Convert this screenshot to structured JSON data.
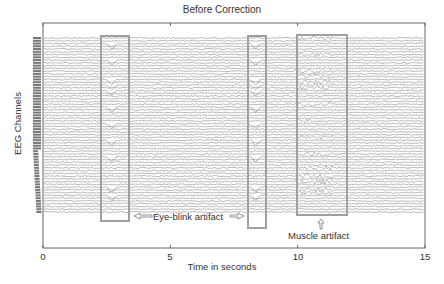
{
  "chart_data": {
    "type": "line",
    "title": "Before Correction",
    "xlabel": "Time in seconds",
    "ylabel": "EEG Channels",
    "xlim": [
      0,
      15
    ],
    "xticks": [
      0,
      5,
      10,
      15
    ],
    "xtick_labels": [
      "0",
      "5",
      "10",
      "15"
    ],
    "grid": false,
    "legend": null,
    "channel_count_approx": 64,
    "artifact_regions": [
      {
        "name": "eye-blink-region-1",
        "type": "Eye-blink artifact",
        "t_start": 2.3,
        "t_end": 3.1
      },
      {
        "name": "eye-blink-region-2",
        "type": "Eye-blink artifact",
        "t_start": 8.1,
        "t_end": 8.6
      },
      {
        "name": "muscle-region",
        "type": "Muscle artifact",
        "t_start": 9.8,
        "t_end": 11.5
      }
    ],
    "annotations": [
      {
        "text": "Eye-blink artifact",
        "arrows": "double-headed, pointing to both eye-blink regions"
      },
      {
        "text": "Muscle artifact",
        "arrows": "upward arrow pointing to muscle region"
      }
    ]
  },
  "labels": {
    "title": "Before Correction",
    "xlabel": "Time in seconds",
    "ylabel": "EEG Channels",
    "eye_blink": "Eye-blink artifact",
    "muscle": "Muscle artifact",
    "ticks": [
      "0",
      "5",
      "10",
      "15"
    ]
  },
  "colors": {
    "trace": "#8a8a8a",
    "box": "#a0a0a0",
    "axis": "#666666"
  }
}
